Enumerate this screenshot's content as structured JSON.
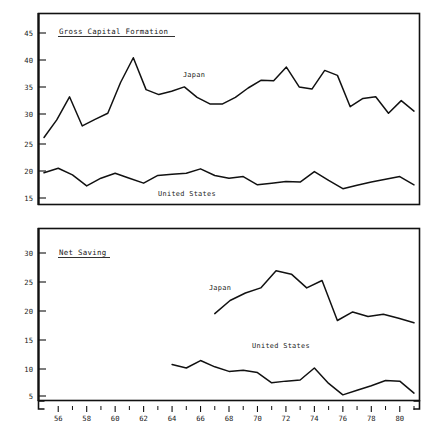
{
  "figure": {
    "panels": [
      {
        "id": "gross-capital-formation",
        "title": "Gross Capital Formation"
      },
      {
        "id": "net-saving",
        "title": "Net Saving"
      }
    ],
    "series_labels": {
      "japan": "Japan",
      "united_states": "United States"
    }
  },
  "axis": {
    "x_ticks_labeled": [
      "56",
      "58",
      "60",
      "62",
      "64",
      "66",
      "68",
      "70",
      "72",
      "74",
      "76",
      "78",
      "80"
    ],
    "y_ticks_top": [
      "45",
      "40",
      "35",
      "30",
      "25",
      "20",
      "15"
    ],
    "y_ticks_bottom": [
      "30",
      "25",
      "20",
      "15",
      "10",
      "5"
    ]
  },
  "chart_data": [
    {
      "type": "line",
      "title": "Gross Capital Formation",
      "xlabel": "",
      "ylabel": "",
      "xlim": [
        1955,
        1981
      ],
      "ylim": [
        13,
        47.5
      ],
      "grid": false,
      "legend": "inline-annotation",
      "x": [
        1955,
        1956,
        1957,
        1958,
        1959,
        1960,
        1961,
        1962,
        1963,
        1964,
        1965,
        1966,
        1967,
        1968,
        1969,
        1970,
        1971,
        1972,
        1973,
        1974,
        1975,
        1976,
        1977,
        1978,
        1979,
        1980,
        1981
      ],
      "series": [
        {
          "name": "Japan",
          "values": [
            26.0,
            29.2,
            33.4,
            28.1,
            29.3,
            30.4,
            36.0,
            40.5,
            34.7,
            33.8,
            34.4,
            35.2,
            33.3,
            32.1,
            32.1,
            33.3,
            35.0,
            36.4,
            36.3,
            38.8,
            35.2,
            34.8,
            38.2,
            37.3,
            31.6,
            33.1,
            33.4,
            30.4,
            32.7,
            30.8
          ]
        },
        {
          "name": "United States",
          "values": [
            19.6,
            20.4,
            19.2,
            17.2,
            18.6,
            19.5,
            18.6,
            17.7,
            19.1,
            19.3,
            19.5,
            20.3,
            19.1,
            18.6,
            18.9,
            17.4,
            17.7,
            18.0,
            17.9,
            19.8,
            18.2,
            16.7,
            17.3,
            17.9,
            18.4,
            18.9,
            17.4
          ]
        }
      ]
    },
    {
      "type": "line",
      "title": "Net Saving",
      "xlabel": "",
      "ylabel": "",
      "xlim": [
        1955,
        1981
      ],
      "ylim": [
        3,
        33
      ],
      "grid": false,
      "legend": "inline-annotation",
      "series": [
        {
          "name": "Japan",
          "x": [
            1967,
            1968,
            1969,
            1970,
            1971,
            1972,
            1973,
            1974,
            1975,
            1976,
            1977,
            1978,
            1979,
            1980,
            1981
          ],
          "values": [
            19.4,
            21.7,
            23.0,
            23.9,
            26.9,
            26.3,
            23.9,
            25.2,
            18.2,
            19.7,
            18.9,
            19.3,
            18.6,
            17.8
          ]
        },
        {
          "name": "United States",
          "x": [
            1964,
            1965,
            1966,
            1967,
            1968,
            1969,
            1970,
            1971,
            1972,
            1973,
            1974,
            1975,
            1976,
            1977,
            1978,
            1979,
            1980,
            1981
          ],
          "values": [
            10.5,
            9.9,
            11.2,
            10.1,
            9.3,
            9.5,
            9.1,
            7.3,
            7.6,
            7.8,
            9.9,
            7.2,
            5.2,
            6.0,
            6.8,
            7.7,
            7.6,
            5.5
          ]
        }
      ]
    }
  ]
}
